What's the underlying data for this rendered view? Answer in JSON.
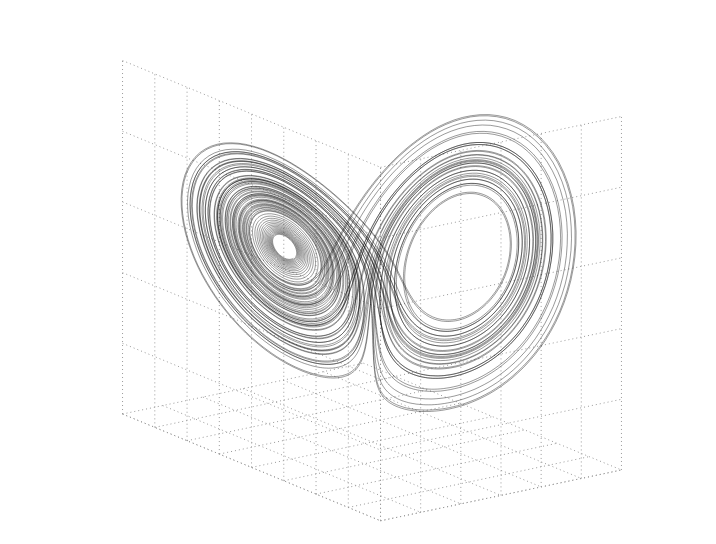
{
  "chart_data": {
    "type": "line3d",
    "title": "",
    "xlabel": "",
    "ylabel": "",
    "zlabel": "",
    "grid": true,
    "legend": null,
    "description": "Lorenz attractor trajectory (butterfly) drawn as a thin black 3D line over a dotted 3D grid box; no tick labels shown",
    "system": {
      "name": "Lorenz",
      "sigma": 10,
      "rho": 28,
      "beta": 2.6667,
      "initial_state": [
        0.1,
        0.0,
        0.0
      ],
      "dt": 0.005,
      "steps": 16000,
      "skip_transient": 300
    },
    "axis_ranges": {
      "x": [
        -20,
        20
      ],
      "y": [
        -30,
        30
      ],
      "z": [
        0,
        50
      ]
    },
    "grid_divisions": {
      "x": 6,
      "y": 8,
      "z": 5
    },
    "features": {
      "left_lobe_hole_center_px": [
        250,
        255
      ],
      "right_lobe_hole_center_px": [
        495,
        260
      ],
      "bottom_cusp_px": [
        385,
        405
      ]
    }
  },
  "style": {
    "background": "#ffffff",
    "line_color": "#111111",
    "grid_color": "#9a9a9a"
  }
}
